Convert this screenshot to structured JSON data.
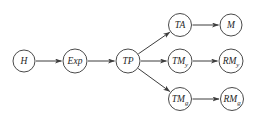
{
  "diagram": {
    "type": "directed-graph",
    "background_color": "#ffffff",
    "stroke_color": "#4a4a4a",
    "text_color": "#1f1f1f",
    "nodes": [
      {
        "id": "H",
        "label": "H",
        "sub": ""
      },
      {
        "id": "Exp",
        "label": "Exp",
        "sub": ""
      },
      {
        "id": "TP",
        "label": "TP",
        "sub": ""
      },
      {
        "id": "TA",
        "label": "TA",
        "sub": ""
      },
      {
        "id": "M",
        "label": "M",
        "sub": ""
      },
      {
        "id": "TM_y",
        "label": "TM",
        "sub": "y"
      },
      {
        "id": "RM_y",
        "label": "RM",
        "sub": "y"
      },
      {
        "id": "TM_g",
        "label": "TM",
        "sub": "g"
      },
      {
        "id": "RM_g",
        "label": "RM",
        "sub": "g"
      }
    ],
    "edges": [
      {
        "from": "H",
        "to": "Exp"
      },
      {
        "from": "Exp",
        "to": "TP"
      },
      {
        "from": "TP",
        "to": "TA"
      },
      {
        "from": "TP",
        "to": "TM_y"
      },
      {
        "from": "TP",
        "to": "TM_g"
      },
      {
        "from": "TA",
        "to": "M"
      },
      {
        "from": "TM_y",
        "to": "RM_y"
      },
      {
        "from": "TM_g",
        "to": "RM_g"
      }
    ]
  }
}
